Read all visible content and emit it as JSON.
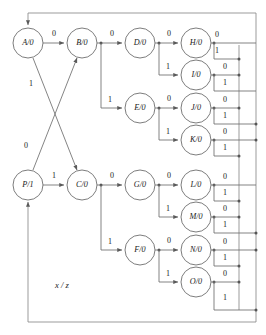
{
  "diagram": {
    "kind": "state-transition-diagram",
    "legend": "x / z",
    "colors": {
      "stroke": "#6e6e6e",
      "bus": "#8a8a8a",
      "text": "#1a1a1a",
      "node_fill": "#ffffff",
      "background": "#ffffff"
    },
    "nodes": [
      {
        "id": "A",
        "label": "A/0",
        "state": "A",
        "output": "0",
        "cx": 28,
        "cy": 43,
        "r": 15
      },
      {
        "id": "B",
        "label": "B/0",
        "state": "B",
        "output": "0",
        "cx": 82,
        "cy": 43,
        "r": 15
      },
      {
        "id": "D",
        "label": "D/0",
        "state": "D",
        "output": "0",
        "cx": 140,
        "cy": 43,
        "r": 15
      },
      {
        "id": "H",
        "label": "H/0",
        "state": "H",
        "output": "0",
        "cx": 196,
        "cy": 43,
        "r": 15
      },
      {
        "id": "I",
        "label": "I/0",
        "state": "I",
        "output": "0",
        "cx": 196,
        "cy": 75,
        "r": 15
      },
      {
        "id": "E",
        "label": "E/0",
        "state": "E",
        "output": "0",
        "cx": 140,
        "cy": 108,
        "r": 15
      },
      {
        "id": "J",
        "label": "J/0",
        "state": "J",
        "output": "0",
        "cx": 196,
        "cy": 108,
        "r": 15
      },
      {
        "id": "K",
        "label": "K/0",
        "state": "K",
        "output": "0",
        "cx": 196,
        "cy": 140,
        "r": 15
      },
      {
        "id": "P",
        "label": "P/1",
        "state": "P",
        "output": "1",
        "cx": 28,
        "cy": 185,
        "r": 15
      },
      {
        "id": "C",
        "label": "C/0",
        "state": "C",
        "output": "0",
        "cx": 82,
        "cy": 185,
        "r": 15
      },
      {
        "id": "G",
        "label": "G/0",
        "state": "G",
        "output": "0",
        "cx": 140,
        "cy": 185,
        "r": 15
      },
      {
        "id": "L",
        "label": "L/0",
        "state": "L",
        "output": "0",
        "cx": 196,
        "cy": 185,
        "r": 15
      },
      {
        "id": "M",
        "label": "M/0",
        "state": "M",
        "output": "0",
        "cx": 196,
        "cy": 217,
        "r": 15
      },
      {
        "id": "F",
        "label": "F/0",
        "state": "F",
        "output": "0",
        "cx": 140,
        "cy": 250,
        "r": 15
      },
      {
        "id": "N",
        "label": "N/0",
        "state": "N",
        "output": "0",
        "cx": 196,
        "cy": 250,
        "r": 15
      },
      {
        "id": "O",
        "label": "O/0",
        "state": "O",
        "output": "0",
        "cx": 196,
        "cy": 282,
        "r": 15
      }
    ],
    "transitions": [
      {
        "from": "A",
        "to": "B",
        "input": "0"
      },
      {
        "from": "A",
        "to": "C",
        "input": "1"
      },
      {
        "from": "P",
        "to": "B",
        "input": "0"
      },
      {
        "from": "P",
        "to": "C",
        "input": "1"
      },
      {
        "from": "B",
        "to": "D",
        "input": "0"
      },
      {
        "from": "B",
        "to": "E",
        "input": "1"
      },
      {
        "from": "C",
        "to": "G",
        "input": "0"
      },
      {
        "from": "C",
        "to": "F",
        "input": "1"
      },
      {
        "from": "D",
        "to": "H",
        "input": "0"
      },
      {
        "from": "D",
        "to": "I",
        "input": "1"
      },
      {
        "from": "E",
        "to": "J",
        "input": "0"
      },
      {
        "from": "E",
        "to": "K",
        "input": "1"
      },
      {
        "from": "G",
        "to": "L",
        "input": "0"
      },
      {
        "from": "G",
        "to": "M",
        "input": "1"
      },
      {
        "from": "F",
        "to": "N",
        "input": "0"
      },
      {
        "from": "F",
        "to": "O",
        "input": "1"
      },
      {
        "from": "H",
        "to": "A",
        "input": "0"
      },
      {
        "from": "H",
        "to": "P",
        "input": "1"
      },
      {
        "from": "I",
        "to": "A",
        "input": "0"
      },
      {
        "from": "I",
        "to": "P",
        "input": "1"
      },
      {
        "from": "J",
        "to": "A",
        "input": "0"
      },
      {
        "from": "J",
        "to": "P",
        "input": "1"
      },
      {
        "from": "K",
        "to": "A",
        "input": "0"
      },
      {
        "from": "K",
        "to": "P",
        "input": "1"
      },
      {
        "from": "L",
        "to": "A",
        "input": "0"
      },
      {
        "from": "L",
        "to": "P",
        "input": "1"
      },
      {
        "from": "M",
        "to": "A",
        "input": "0"
      },
      {
        "from": "M",
        "to": "P",
        "input": "1"
      },
      {
        "from": "N",
        "to": "A",
        "input": "0"
      },
      {
        "from": "N",
        "to": "P",
        "input": "1"
      },
      {
        "from": "O",
        "to": "A",
        "input": "0"
      },
      {
        "from": "O",
        "to": "P",
        "input": "1"
      }
    ],
    "edge_labels": {
      "a_to_b": "0",
      "a_to_c": "1",
      "p_to_b": "0",
      "p_to_c": "1",
      "b_to_d": "0",
      "b_to_e": "1",
      "c_to_g": "0",
      "c_to_f": "1",
      "d_to_h": "0",
      "d_to_i": "1",
      "e_to_j": "0",
      "e_to_k": "1",
      "g_to_l": "0",
      "g_to_m": "1",
      "f_to_n": "0",
      "f_to_o": "1",
      "h_zero": "0",
      "h_one": "1",
      "i_zero": "0",
      "i_one": "1",
      "j_zero": "0",
      "j_one": "1",
      "k_zero": "0",
      "k_one": "1",
      "l_zero": "0",
      "l_one": "1",
      "m_zero": "0",
      "m_one": "1",
      "n_zero": "0",
      "n_one": "1",
      "o_zero": "0",
      "o_one": "1"
    }
  }
}
